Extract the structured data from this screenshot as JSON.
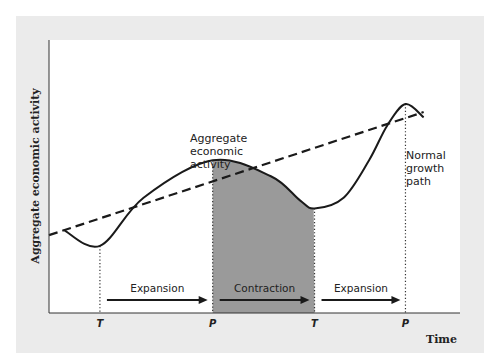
{
  "chart_data": {
    "type": "line",
    "title": "",
    "xlabel": "Time",
    "ylabel": "Aggregate economic activity",
    "x_range": [
      0,
      100
    ],
    "y_range": [
      0,
      100
    ],
    "grid": false,
    "series": [
      {
        "name": "Aggregate economic activity",
        "style": "solid",
        "points": [
          [
            4,
            24
          ],
          [
            14,
            18
          ],
          [
            26,
            36
          ],
          [
            45,
            50
          ],
          [
            61,
            44
          ],
          [
            69,
            35
          ],
          [
            73,
            32
          ],
          [
            81,
            36
          ],
          [
            88,
            50
          ],
          [
            93,
            63
          ],
          [
            98,
            71
          ],
          [
            103,
            66
          ]
        ]
      },
      {
        "name": "Normal growth path",
        "style": "dashed",
        "points": [
          [
            0,
            22
          ],
          [
            103,
            68
          ]
        ]
      }
    ],
    "turning_points": [
      {
        "label": "T",
        "x": 14
      },
      {
        "label": "P",
        "x": 45
      },
      {
        "label": "T",
        "x": 73
      },
      {
        "label": "P",
        "x": 98
      }
    ],
    "phases": [
      {
        "label": "Expansion",
        "from": 14,
        "to": 45,
        "shaded": false
      },
      {
        "label": "Contraction",
        "from": 45,
        "to": 73,
        "shaded": true
      },
      {
        "label": "Expansion",
        "from": 73,
        "to": 98,
        "shaded": false
      }
    ],
    "annotations": [
      {
        "text_lines": [
          "Aggregate",
          "economic",
          "activity"
        ],
        "target": "curve"
      },
      {
        "text_lines": [
          "Normal",
          "growth",
          "path"
        ],
        "target": "dashed-line"
      }
    ],
    "colors": {
      "panel": "#ebebeb",
      "plot": "#ffffff",
      "shade": "#9a9a9a",
      "line": "#1a1a1a"
    }
  }
}
